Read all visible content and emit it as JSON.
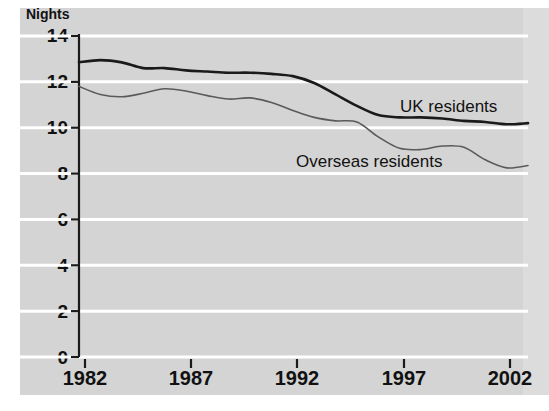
{
  "chart_data": {
    "type": "line",
    "title": "",
    "subtitle": "",
    "xlabel": "",
    "ylabel": "Nights",
    "ylim": [
      0,
      14
    ],
    "xlim": [
      1982,
      2003
    ],
    "yticks": [
      0,
      2,
      4,
      6,
      8,
      10,
      12,
      14
    ],
    "ytick_labels": [
      "0",
      "2",
      "4",
      "6",
      "8",
      "10",
      "12",
      "14"
    ],
    "xticks": [
      1982,
      1987,
      1992,
      1997,
      2002
    ],
    "xtick_labels": [
      "1982",
      "1987",
      "1992",
      "1997",
      "2002"
    ],
    "grid": "horizontal-white",
    "legend": "inline-annotations",
    "background_color": "#d4d4d4",
    "gridline_color": "#ffffff",
    "axis_color": "#1a1a1a",
    "x": [
      1982,
      1983,
      1984,
      1985,
      1986,
      1987,
      1988,
      1989,
      1990,
      1991,
      1992,
      1993,
      1994,
      1995,
      1996,
      1997,
      1998,
      1999,
      2000,
      2001,
      2002,
      2003
    ],
    "series": [
      {
        "name": "UK residents",
        "color": "#1a1a1a",
        "line_width": 2.6,
        "label_position": "right-of-line",
        "values": [
          12.85,
          12.95,
          12.85,
          12.6,
          12.6,
          12.5,
          12.45,
          12.4,
          12.4,
          12.35,
          12.25,
          11.95,
          11.45,
          10.95,
          10.55,
          10.45,
          10.45,
          10.4,
          10.3,
          10.25,
          10.15,
          10.2
        ]
      },
      {
        "name": "Overseas residents",
        "color": "#5a5a5a",
        "line_width": 1.6,
        "label_position": "below-line",
        "values": [
          11.8,
          11.45,
          11.35,
          11.5,
          11.7,
          11.6,
          11.4,
          11.25,
          11.3,
          11.1,
          10.75,
          10.45,
          10.3,
          10.25,
          9.6,
          9.1,
          9.05,
          9.2,
          9.15,
          8.6,
          8.25,
          8.35
        ]
      }
    ]
  },
  "axis": {
    "y_title": "Nights"
  },
  "geometry": {
    "plot_left": 79,
    "plot_right": 528,
    "plot_top": 36,
    "plot_bottom": 357,
    "x_tick_px": [
      85,
      191,
      297,
      404,
      510
    ]
  }
}
